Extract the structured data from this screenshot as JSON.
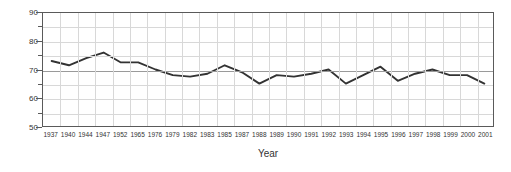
{
  "chart_data": {
    "type": "line",
    "title": "",
    "xlabel": "Year",
    "ylabel": "Percent of Population",
    "ylim": [
      50,
      90
    ],
    "ytick_labels": [
      "50",
      "60",
      "70",
      "80",
      "90"
    ],
    "yticks": [
      50,
      60,
      70,
      80,
      90
    ],
    "yminor_step": 5,
    "grid": "both",
    "legend": "none",
    "line_color": "#333333",
    "categories": [
      "1937",
      "1940",
      "1944",
      "1947",
      "1952",
      "1965",
      "1976",
      "1979",
      "1982",
      "1983",
      "1985",
      "1987",
      "1988",
      "1989",
      "1990",
      "1991",
      "1992",
      "1993",
      "1994",
      "1995",
      "1996",
      "1997",
      "1998",
      "1999",
      "2000",
      "2001"
    ],
    "values": [
      73.0,
      71.5,
      74.0,
      76.0,
      72.5,
      72.5,
      70.0,
      68.0,
      67.5,
      68.5,
      71.5,
      69.0,
      65.0,
      68.0,
      67.5,
      68.5,
      70.0,
      65.0,
      68.0,
      71.0,
      66.0,
      68.5,
      70.0,
      68.0,
      68.0,
      65.0
    ],
    "series": [
      {
        "name": "Percent of Population",
        "values": [
          73.0,
          71.5,
          74.0,
          76.0,
          72.5,
          72.5,
          70.0,
          68.0,
          67.5,
          68.5,
          71.5,
          69.0,
          65.0,
          68.0,
          67.5,
          68.5,
          70.0,
          65.0,
          68.0,
          71.0,
          66.0,
          68.5,
          70.0,
          68.0,
          68.0,
          65.0
        ]
      }
    ]
  }
}
